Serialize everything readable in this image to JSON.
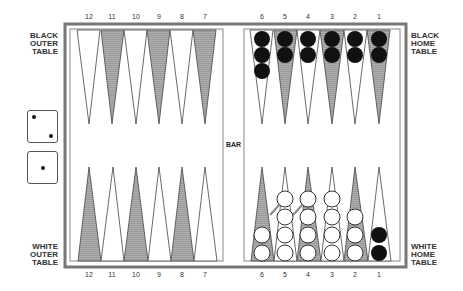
{
  "labels": {
    "black_outer": [
      "BLACK",
      "OUTER",
      "TABLE"
    ],
    "black_home": [
      "BLACK",
      "HOME",
      "TABLE"
    ],
    "white_outer": [
      "WHITE",
      "OUTER",
      "TABLE"
    ],
    "white_home": [
      "WHITE",
      "HOME",
      "TABLE"
    ],
    "bar": "BAR"
  },
  "point_numbers": {
    "left": [
      "12",
      "11",
      "10",
      "9",
      "8",
      "7"
    ],
    "right": [
      "6",
      "5",
      "4",
      "3",
      "2",
      "1"
    ]
  },
  "dice": [
    {
      "value": 2
    },
    {
      "value": 1
    }
  ],
  "colors": {
    "frame": "#777777",
    "shaded_point": "#9a9a9a",
    "black_checker": "#111111",
    "white_checker": "#ffffff"
  },
  "checkers": {
    "top_right": [
      {
        "point": "6",
        "count": 3,
        "color": "black"
      },
      {
        "point": "5",
        "count": 2,
        "color": "black"
      },
      {
        "point": "4",
        "count": 2,
        "color": "black"
      },
      {
        "point": "3",
        "count": 2,
        "color": "black"
      },
      {
        "point": "2",
        "count": 2,
        "color": "black"
      },
      {
        "point": "1",
        "count": 2,
        "color": "black"
      }
    ],
    "bottom_right": [
      {
        "point": "6",
        "count": 2,
        "color": "white"
      },
      {
        "point": "5",
        "count": 4,
        "color": "white"
      },
      {
        "point": "4",
        "count": 4,
        "color": "white"
      },
      {
        "point": "3",
        "count": 4,
        "color": "white"
      },
      {
        "point": "2",
        "count": 3,
        "color": "white"
      },
      {
        "point": "1",
        "count": 2,
        "color": "black"
      }
    ]
  },
  "arrows": [
    {
      "from": "6",
      "to": "5"
    },
    {
      "from": "5",
      "to": "4"
    }
  ]
}
